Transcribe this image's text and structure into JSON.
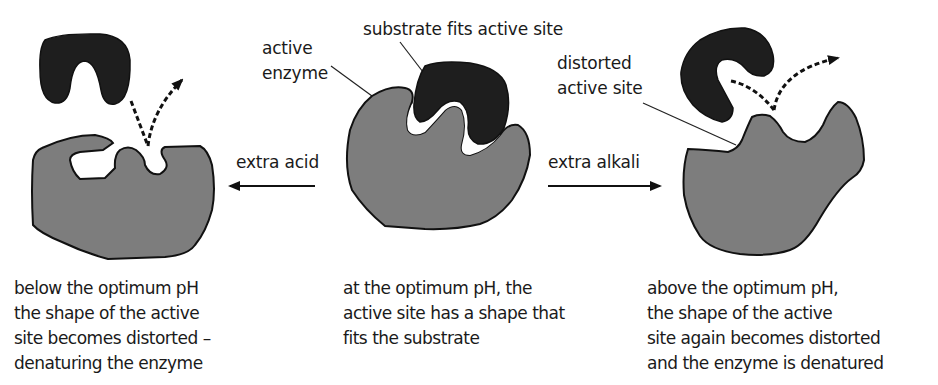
{
  "colors": {
    "enzyme_fill": "#7d7d7d",
    "substrate_fill": "#1e1e1e",
    "outline": "#111111",
    "text": "#1a1a1a",
    "background": "#ffffff"
  },
  "labels": {
    "active_enzyme": [
      "active",
      "enzyme"
    ],
    "substrate_fits": "substrate fits active site",
    "distorted_site": [
      "distorted",
      "active site"
    ],
    "extra_acid": "extra acid",
    "extra_alkali": "extra alkali"
  },
  "captions": {
    "left": [
      "below the optimum pH",
      "the shape of the active",
      "site becomes distorted –",
      "denaturing the enzyme"
    ],
    "middle": [
      "at the optimum pH, the",
      "active site has a shape that",
      "fits the substrate"
    ],
    "right": [
      "above the optimum pH,",
      "the shape of the active",
      "site again becomes distorted",
      "and the enzyme is denatured"
    ]
  },
  "arrows": {
    "acid_direction": "left",
    "alkali_direction": "right"
  }
}
